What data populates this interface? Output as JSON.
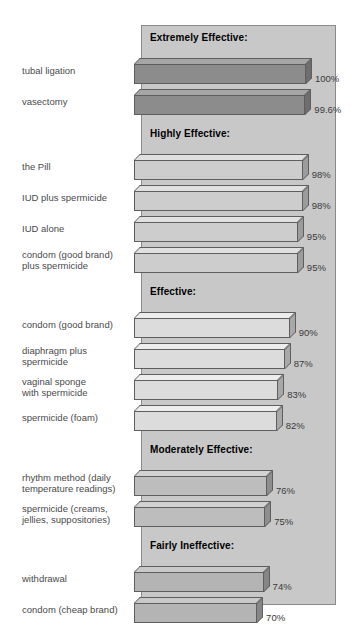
{
  "chart_data": {
    "type": "bar",
    "orientation": "horizontal",
    "title": "",
    "xlabel": "",
    "ylabel": "",
    "xlim": [
      0,
      100
    ],
    "grid": false,
    "legend": "none",
    "value_suffix": "%",
    "groups": [
      {
        "header": "Extremely Effective:",
        "fill": "#8c8c8c",
        "top_fill": "#a6a6a6",
        "side_fill": "#6e6e6e",
        "items": [
          {
            "label": "tubal ligation",
            "value": 100,
            "value_text": "100%"
          },
          {
            "label": "vasectomy",
            "value": 99.6,
            "value_text": "99.6%"
          }
        ]
      },
      {
        "header": "Highly Effective:",
        "fill": "#cdcdcd",
        "top_fill": "#e0e0e0",
        "side_fill": "#9c9c9c",
        "items": [
          {
            "label": "the Pill",
            "value": 98,
            "value_text": "98%"
          },
          {
            "label": "IUD plus spermicide",
            "value": 98,
            "value_text": "98%"
          },
          {
            "label": "IUD alone",
            "value": 95,
            "value_text": "95%"
          },
          {
            "label": "condom (good brand)\nplus spermicide",
            "value": 95,
            "value_text": "95%"
          }
        ]
      },
      {
        "header": "Effective:",
        "fill": "#dcdcdc",
        "top_fill": "#ededed",
        "side_fill": "#a8a8a8",
        "items": [
          {
            "label": "condom (good brand)",
            "value": 90,
            "value_text": "90%"
          },
          {
            "label": "diaphragm plus\nspermicide",
            "value": 87,
            "value_text": "87%"
          },
          {
            "label": "vaginal sponge\nwith spermicide",
            "value": 83,
            "value_text": "83%"
          },
          {
            "label": "spermicide (foam)",
            "value": 82,
            "value_text": "82%"
          }
        ]
      },
      {
        "header": "Moderately Effective:",
        "fill": "#bdbdbd",
        "top_fill": "#d2d2d2",
        "side_fill": "#8e8e8e",
        "items": [
          {
            "label": "rhythm method (daily\ntemperature readings)",
            "value": 76,
            "value_text": "76%"
          },
          {
            "label": "spermicide (creams,\njellies, suppositories)",
            "value": 75,
            "value_text": "75%"
          }
        ]
      },
      {
        "header": "Fairly Ineffective:",
        "fill": "#b4b4b4",
        "top_fill": "#c9c9c9",
        "side_fill": "#868686",
        "items": [
          {
            "label": "withdrawal",
            "value": 74,
            "value_text": "74%"
          },
          {
            "label": "condom (cheap brand)",
            "value": 70,
            "value_text": "70%"
          }
        ]
      },
      {
        "header": "Unreliable:",
        "fill": "#b4b4b4",
        "top_fill": "#c9c9c9",
        "side_fill": "#868686",
        "items": [
          {
            "label": "douche",
            "value": 40,
            "value_text": "40%"
          },
          {
            "label": "chance (no method)",
            "value": 10,
            "value_text": "10%"
          }
        ]
      }
    ]
  },
  "layout": {
    "panel_bg": "#c8c8c8",
    "panel_border": "#8a8a8a",
    "label_color": "#4a4a4a",
    "header_color": "#000000"
  }
}
